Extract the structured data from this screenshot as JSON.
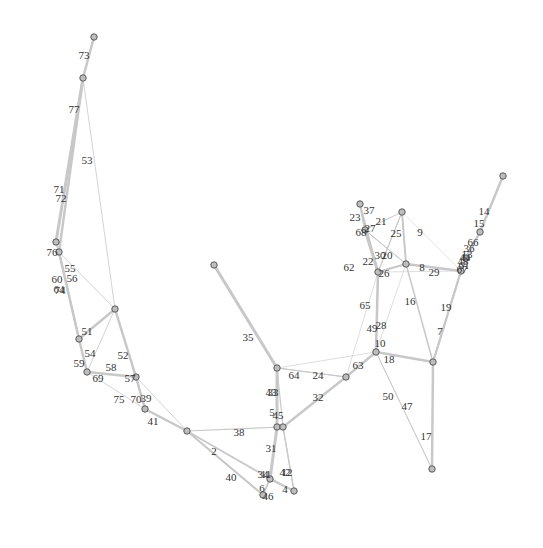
{
  "graph": {
    "type": "network",
    "nodes": [
      {
        "id": "n_top",
        "x": 94,
        "y": 37
      },
      {
        "id": "n_a",
        "x": 83,
        "y": 78
      },
      {
        "id": "n_b",
        "x": 56,
        "y": 242
      },
      {
        "id": "n_c",
        "x": 59,
        "y": 252
      },
      {
        "id": "n_d",
        "x": 115,
        "y": 309
      },
      {
        "id": "n_e",
        "x": 79,
        "y": 339
      },
      {
        "id": "n_f",
        "x": 87,
        "y": 372
      },
      {
        "id": "n_g",
        "x": 136,
        "y": 377
      },
      {
        "id": "n_h",
        "x": 145,
        "y": 409
      },
      {
        "id": "n_i",
        "x": 187,
        "y": 431
      },
      {
        "id": "n_j",
        "x": 214,
        "y": 265
      },
      {
        "id": "n_k",
        "x": 277,
        "y": 368
      },
      {
        "id": "n_l",
        "x": 277,
        "y": 427
      },
      {
        "id": "n_m",
        "x": 283,
        "y": 427
      },
      {
        "id": "n_n",
        "x": 270,
        "y": 479
      },
      {
        "id": "n_o",
        "x": 263,
        "y": 495
      },
      {
        "id": "n_p",
        "x": 294,
        "y": 491
      },
      {
        "id": "n_q",
        "x": 346,
        "y": 377
      },
      {
        "id": "n_r",
        "x": 376,
        "y": 352
      },
      {
        "id": "n_s",
        "x": 433,
        "y": 362
      },
      {
        "id": "n_t",
        "x": 432,
        "y": 469
      },
      {
        "id": "n_u",
        "x": 360,
        "y": 204
      },
      {
        "id": "n_v",
        "x": 365,
        "y": 230
      },
      {
        "id": "n_w",
        "x": 402,
        "y": 212
      },
      {
        "id": "n_x",
        "x": 378,
        "y": 272
      },
      {
        "id": "n_y",
        "x": 406,
        "y": 264
      },
      {
        "id": "n_z",
        "x": 461,
        "y": 271
      },
      {
        "id": "n_aa",
        "x": 503,
        "y": 176
      },
      {
        "id": "n_ab",
        "x": 480,
        "y": 232
      },
      {
        "id": "n_ac",
        "x": 466,
        "y": 258
      }
    ],
    "edges": [
      {
        "from": "n_top",
        "to": "n_a",
        "w": 2.5,
        "label": "73",
        "lx": 84,
        "ly": 56
      },
      {
        "from": "n_a",
        "to": "n_b",
        "w": 3,
        "label": "77",
        "lx": 74,
        "ly": 110
      },
      {
        "from": "n_a",
        "to": "n_c",
        "w": 2.5,
        "label": "71",
        "lx": 59,
        "ly": 190
      },
      {
        "from": "n_a",
        "to": "n_d",
        "w": 0.8,
        "label": "53",
        "lx": 87,
        "ly": 161
      },
      {
        "from": "n_b",
        "to": "n_c",
        "w": 1.5,
        "label": "72",
        "lx": 61,
        "ly": 199
      },
      {
        "from": "n_c",
        "to": "n_e",
        "w": 2.5,
        "label": "76",
        "lx": 52,
        "ly": 253
      },
      {
        "from": "n_c",
        "to": "n_d",
        "w": 0.8,
        "label": "55",
        "lx": 70,
        "ly": 269
      },
      {
        "from": "n_c",
        "to": "n_e",
        "w": 1.2,
        "label": "56",
        "lx": 72,
        "ly": 279
      },
      {
        "from": "n_c",
        "to": "n_e",
        "w": 1.2,
        "label": "60",
        "lx": 57,
        "ly": 280
      },
      {
        "from": "n_c",
        "to": "n_e",
        "w": 1.2,
        "label": "64",
        "lx": 59,
        "ly": 290
      },
      {
        "from": "n_c",
        "to": "n_e",
        "w": 1.2,
        "label": "74",
        "lx": 60,
        "ly": 291
      },
      {
        "from": "n_d",
        "to": "n_e",
        "w": 2.5,
        "label": "51",
        "lx": 87,
        "ly": 332
      },
      {
        "from": "n_d",
        "to": "n_g",
        "w": 2.5,
        "label": "52",
        "lx": 123,
        "ly": 356
      },
      {
        "from": "n_d",
        "to": "n_f",
        "w": 0.8,
        "label": "54",
        "lx": 90,
        "ly": 354
      },
      {
        "from": "n_e",
        "to": "n_f",
        "w": 2.5,
        "label": "59",
        "lx": 79,
        "ly": 364
      },
      {
        "from": "n_f",
        "to": "n_g",
        "w": 2.5,
        "label": "69",
        "lx": 98,
        "ly": 379
      },
      {
        "from": "n_f",
        "to": "n_g",
        "w": 0.8,
        "label": "58",
        "lx": 111,
        "ly": 368
      },
      {
        "from": "n_g",
        "to": "n_h",
        "w": 2.5,
        "label": "57",
        "lx": 130,
        "ly": 379
      },
      {
        "from": "n_g",
        "to": "n_h",
        "w": 1.5,
        "label": "70",
        "lx": 136,
        "ly": 400
      },
      {
        "from": "n_g",
        "to": "n_i",
        "w": 0.8,
        "label": "39",
        "lx": 146,
        "ly": 399
      },
      {
        "from": "n_f",
        "to": "n_h",
        "w": 0.8,
        "label": "75",
        "lx": 119,
        "ly": 400
      },
      {
        "from": "n_h",
        "to": "n_i",
        "w": 2.5,
        "label": "41",
        "lx": 153,
        "ly": 422
      },
      {
        "from": "n_i",
        "to": "n_m",
        "w": 1.2,
        "label": "38",
        "lx": 239,
        "ly": 433
      },
      {
        "from": "n_i",
        "to": "n_n",
        "w": 1.5,
        "label": "2",
        "lx": 214,
        "ly": 452
      },
      {
        "from": "n_i",
        "to": "n_o",
        "w": 2,
        "label": "40",
        "lx": 231,
        "ly": 478
      },
      {
        "from": "n_j",
        "to": "n_k",
        "w": 3,
        "label": "35",
        "lx": 248,
        "ly": 338
      },
      {
        "from": "n_k",
        "to": "n_q",
        "w": 1,
        "label": "64",
        "lx": 294,
        "ly": 376
      },
      {
        "from": "n_k",
        "to": "n_l",
        "w": 3,
        "label": "43",
        "lx": 271,
        "ly": 393
      },
      {
        "from": "n_k",
        "to": "n_l",
        "w": 2,
        "label": "33",
        "lx": 273,
        "ly": 393
      },
      {
        "from": "n_l",
        "to": "n_m",
        "w": 2,
        "label": "5",
        "lx": 272,
        "ly": 413
      },
      {
        "from": "n_k",
        "to": "n_m",
        "w": 1.2,
        "label": "45",
        "lx": 278,
        "ly": 416
      },
      {
        "from": "n_l",
        "to": "n_n",
        "w": 3,
        "label": "31",
        "lx": 271,
        "ly": 449
      },
      {
        "from": "n_m",
        "to": "n_p",
        "w": 1.2,
        "label": "42",
        "lx": 285,
        "ly": 473
      },
      {
        "from": "n_m",
        "to": "n_p",
        "w": 1.2,
        "label": "12",
        "lx": 287,
        "ly": 473
      },
      {
        "from": "n_l",
        "to": "n_n",
        "w": 1.5,
        "label": "34",
        "lx": 263,
        "ly": 475
      },
      {
        "from": "n_l",
        "to": "n_n",
        "w": 1.5,
        "label": "11",
        "lx": 266,
        "ly": 475
      },
      {
        "from": "n_n",
        "to": "n_p",
        "w": 2,
        "label": "4",
        "lx": 285,
        "ly": 490
      },
      {
        "from": "n_n",
        "to": "n_o",
        "w": 1.5,
        "label": "6",
        "lx": 262,
        "ly": 489
      },
      {
        "from": "n_n",
        "to": "n_o",
        "w": 1.5,
        "label": "46",
        "lx": 268,
        "ly": 497
      },
      {
        "from": "n_m",
        "to": "n_q",
        "w": 2.5,
        "label": "32",
        "lx": 318,
        "ly": 398
      },
      {
        "from": "n_k",
        "to": "n_q",
        "w": 1,
        "label": "24",
        "lx": 318,
        "ly": 376
      },
      {
        "from": "n_q",
        "to": "n_r",
        "w": 2.5,
        "label": "63",
        "lx": 358,
        "ly": 366
      },
      {
        "from": "n_r",
        "to": "n_s",
        "w": 2.5,
        "label": "18",
        "lx": 389,
        "ly": 360
      },
      {
        "from": "n_r",
        "to": "n_t",
        "w": 0.8,
        "label": "50",
        "lx": 388,
        "ly": 397
      },
      {
        "from": "n_r",
        "to": "n_t",
        "w": 0.8,
        "label": "47",
        "lx": 407,
        "ly": 407
      },
      {
        "from": "n_s",
        "to": "n_t",
        "w": 2.5,
        "label": "17",
        "lx": 426,
        "ly": 437
      },
      {
        "from": "n_s",
        "to": "n_z",
        "w": 2,
        "label": "7",
        "lx": 440,
        "ly": 332
      },
      {
        "from": "n_s",
        "to": "n_y",
        "w": 1.5,
        "label": "16",
        "lx": 410,
        "ly": 302
      },
      {
        "from": "n_x",
        "to": "n_r",
        "w": 2.5,
        "label": "65",
        "lx": 365,
        "ly": 306
      },
      {
        "from": "n_x",
        "to": "n_r",
        "w": 1,
        "label": "49",
        "lx": 372,
        "ly": 329
      },
      {
        "from": "n_x",
        "to": "n_r",
        "w": 1,
        "label": "28",
        "lx": 381,
        "ly": 326
      },
      {
        "from": "n_x",
        "to": "n_r",
        "w": 1,
        "label": "10",
        "lx": 380,
        "ly": 344
      },
      {
        "from": "n_u",
        "to": "n_v",
        "w": 2,
        "label": "23",
        "lx": 355,
        "ly": 218
      },
      {
        "from": "n_u",
        "to": "n_v",
        "w": 1,
        "label": "37",
        "lx": 369,
        "ly": 211
      },
      {
        "from": "n_v",
        "to": "n_x",
        "w": 3,
        "label": "22",
        "lx": 368,
        "ly": 262
      },
      {
        "from": "n_v",
        "to": "n_x",
        "w": 1,
        "label": "62",
        "lx": 349,
        "ly": 268
      },
      {
        "from": "n_v",
        "to": "n_w",
        "w": 1,
        "label": "21",
        "lx": 381,
        "ly": 222
      },
      {
        "from": "n_v",
        "to": "n_y",
        "w": 1,
        "label": "27",
        "lx": 370,
        "ly": 229
      },
      {
        "from": "n_v",
        "to": "n_y",
        "w": 1,
        "label": "68",
        "lx": 361,
        "ly": 233
      },
      {
        "from": "n_w",
        "to": "n_y",
        "w": 2,
        "label": "25",
        "lx": 396,
        "ly": 234
      },
      {
        "from": "n_w",
        "to": "n_x",
        "w": 1,
        "label": "30",
        "lx": 380,
        "ly": 256
      },
      {
        "from": "n_w",
        "to": "n_x",
        "w": 1,
        "label": "20",
        "lx": 387,
        "ly": 256
      },
      {
        "from": "n_x",
        "to": "n_y",
        "w": 2,
        "label": "26",
        "lx": 384,
        "ly": 274
      },
      {
        "from": "n_y",
        "to": "n_z",
        "w": 2.5,
        "label": "8",
        "lx": 422,
        "ly": 268
      },
      {
        "from": "n_y",
        "to": "n_z",
        "w": 1,
        "label": "29",
        "lx": 434,
        "ly": 273
      },
      {
        "from": "n_w",
        "to": "n_z",
        "w": 0.5,
        "label": "9",
        "lx": 420,
        "ly": 233
      },
      {
        "from": "n_s",
        "to": "n_z",
        "w": 2,
        "label": "19",
        "lx": 446,
        "ly": 308
      },
      {
        "from": "n_aa",
        "to": "n_ab",
        "w": 2.5,
        "label": "14",
        "lx": 484,
        "ly": 212
      },
      {
        "from": "n_ab",
        "to": "n_ac",
        "w": 2.5,
        "label": "15",
        "lx": 479,
        "ly": 224
      },
      {
        "from": "n_ac",
        "to": "n_z",
        "w": 2.5,
        "label": "66",
        "lx": 473,
        "ly": 243
      },
      {
        "from": "n_ac",
        "to": "n_z",
        "w": 1.5,
        "label": "36",
        "lx": 469,
        "ly": 249
      },
      {
        "from": "n_ac",
        "to": "n_z",
        "w": 1.5,
        "label": "44",
        "lx": 465,
        "ly": 258
      },
      {
        "from": "n_ac",
        "to": "n_z",
        "w": 1.5,
        "label": "48",
        "lx": 463,
        "ly": 262
      },
      {
        "from": "n_ac",
        "to": "n_z",
        "w": 1.5,
        "label": "13",
        "lx": 467,
        "ly": 255
      },
      {
        "from": "n_ac",
        "to": "n_z",
        "w": 1.5,
        "label": "61",
        "lx": 464,
        "ly": 266
      },
      {
        "from": "n_ac",
        "to": "n_z",
        "w": 1.5,
        "label": "67",
        "lx": 462,
        "ly": 270
      },
      {
        "from": "n_d",
        "to": "n_h",
        "w": 0.6,
        "label": "",
        "lx": 0,
        "ly": 0
      },
      {
        "from": "n_k",
        "to": "n_r",
        "w": 0.6,
        "label": "",
        "lx": 0,
        "ly": 0
      },
      {
        "from": "n_q",
        "to": "n_x",
        "w": 0.6,
        "label": "",
        "lx": 0,
        "ly": 0
      },
      {
        "from": "n_x",
        "to": "n_z",
        "w": 0.6,
        "label": "",
        "lx": 0,
        "ly": 0
      },
      {
        "from": "n_r",
        "to": "n_y",
        "w": 0.6,
        "label": "",
        "lx": 0,
        "ly": 0
      },
      {
        "from": "n_u",
        "to": "n_x",
        "w": 1.5,
        "label": "",
        "lx": 0,
        "ly": 0
      },
      {
        "from": "n_i",
        "to": "n_p",
        "w": 0.6,
        "label": "",
        "lx": 0,
        "ly": 0
      }
    ]
  }
}
